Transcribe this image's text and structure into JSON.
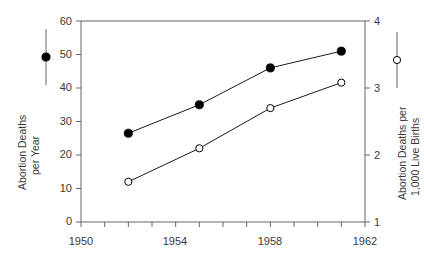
{
  "chart_data": {
    "type": "line",
    "title": "",
    "xlabel": "",
    "xlim": [
      1950,
      1962
    ],
    "xticks": [
      1950,
      1951,
      1952,
      1953,
      1954,
      1955,
      1956,
      1957,
      1958,
      1959,
      1960,
      1961,
      1962
    ],
    "xtick_labels": [
      "1950",
      "1954",
      "1958",
      "1962"
    ],
    "xtick_labeled_values": [
      1950,
      1954,
      1958,
      1962
    ],
    "grid": false,
    "legend_position": "outside-left-and-right",
    "axes": [
      {
        "id": "left",
        "ylabel": "Abortion Deaths per Year",
        "ylabel_line1": "Abortion Deaths",
        "ylabel_line2": "per Year",
        "ylim": [
          0,
          60
        ],
        "yticks": [
          0,
          10,
          20,
          30,
          40,
          50,
          60
        ],
        "ytick_labels": [
          "0",
          "10",
          "20",
          "30",
          "40",
          "50",
          "60"
        ],
        "marker": "filled-circle"
      },
      {
        "id": "right",
        "ylabel": "Abortion Deaths per 1,000 Live Births",
        "ylabel_line1": "Abortion Deaths per",
        "ylabel_line2": "1,000 Live Births",
        "ylim": [
          1,
          4
        ],
        "yticks": [
          1,
          2,
          3,
          4
        ],
        "ytick_labels": [
          "1",
          "2",
          "3",
          "4"
        ],
        "marker": "open-circle"
      }
    ],
    "series": [
      {
        "name": "Abortion Deaths per Year",
        "axis": "left",
        "marker": "filled-circle",
        "color": "#000000",
        "x": [
          1952,
          1955,
          1958,
          1961
        ],
        "values": [
          26.5,
          35,
          46,
          51
        ]
      },
      {
        "name": "Abortion Deaths per 1,000 Live Births",
        "axis": "right",
        "marker": "open-circle",
        "color": "#000000",
        "x": [
          1952,
          1955,
          1958,
          1961
        ],
        "values": [
          1.6,
          2.1,
          2.7,
          3.08
        ]
      }
    ]
  },
  "legend": {
    "left_marker": "filled-circle-marker",
    "right_marker": "open-circle-marker"
  }
}
